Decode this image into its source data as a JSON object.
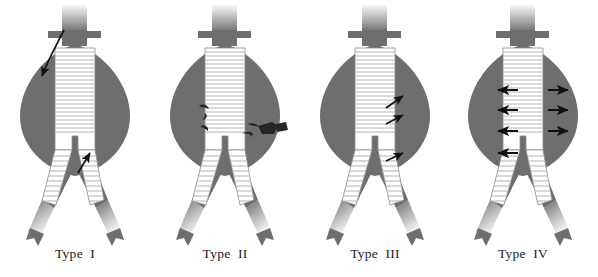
{
  "figure": {
    "background_color": "#ffffff",
    "width": 598,
    "height": 277
  },
  "colors": {
    "vessel_fill": "#6e6e6e",
    "aneurysm_sac": "#6e6e6e",
    "graft_fill": "#ffffff",
    "graft_ring": "#b4b4b4",
    "graft_outline": "#8a8a8a",
    "arrow": "#111111",
    "collateral_mark": "#262626",
    "caption_text": "#1a1a1a",
    "background": "#ffffff"
  },
  "panels": [
    {
      "id": "type-1",
      "caption": "Type  I",
      "leak_name": "attachment-site-endoleak",
      "x": 0,
      "arrows": [
        {
          "name": "proximal-neck-leak-arrow",
          "style": "curved",
          "x1": 64,
          "y1": 30,
          "x2": 40,
          "y2": 78
        },
        {
          "name": "distal-iliac-leak-arrow",
          "style": "straight",
          "x1": 78,
          "y1": 172,
          "x2": 90,
          "y2": 152
        }
      ],
      "collaterals": []
    },
    {
      "id": "type-2",
      "caption": "Type  II",
      "leak_name": "branch-vessel-retrograde-endoleak",
      "x": 150,
      "arrows": [],
      "collaterals": [
        {
          "name": "lumbar-branch-left-upper",
          "cx": 53,
          "cy": 111
        },
        {
          "name": "lumbar-branch-left-lower",
          "cx": 54,
          "cy": 128
        },
        {
          "name": "lumbar-branch-right-stub",
          "cx": 103,
          "cy": 130
        },
        {
          "name": "inferior-mesenteric-branch",
          "cx": 116,
          "cy": 132
        }
      ]
    },
    {
      "id": "type-3",
      "caption": "Type  III",
      "leak_name": "modular-disconnection-or-fabric-tear-endoleak",
      "x": 300,
      "arrows": [
        {
          "name": "graft-defect-arrow-upper",
          "style": "straight",
          "x1": 86,
          "y1": 106,
          "x2": 102,
          "y2": 96
        },
        {
          "name": "graft-defect-arrow-middle",
          "style": "straight",
          "x1": 86,
          "y1": 122,
          "x2": 102,
          "y2": 114
        },
        {
          "name": "graft-defect-arrow-lower",
          "style": "straight",
          "x1": 86,
          "y1": 160,
          "x2": 102,
          "y2": 152
        }
      ],
      "collaterals": []
    },
    {
      "id": "type-4",
      "caption": "Type  IV",
      "leak_name": "graft-porosity-endoleak",
      "x": 448,
      "arrows": [
        {
          "name": "porosity-arrow-left-1",
          "style": "straight",
          "x1": 72,
          "y1": 91,
          "x2": 52,
          "y2": 91
        },
        {
          "name": "porosity-arrow-left-2",
          "style": "straight",
          "x1": 72,
          "y1": 110,
          "x2": 52,
          "y2": 110
        },
        {
          "name": "porosity-arrow-left-3",
          "style": "straight",
          "x1": 72,
          "y1": 131,
          "x2": 52,
          "y2": 131
        },
        {
          "name": "porosity-arrow-left-4",
          "style": "straight",
          "x1": 72,
          "y1": 153,
          "x2": 52,
          "y2": 153
        },
        {
          "name": "porosity-arrow-right-1",
          "style": "straight",
          "x1": 100,
          "y1": 91,
          "x2": 120,
          "y2": 91
        },
        {
          "name": "porosity-arrow-right-2",
          "style": "straight",
          "x1": 100,
          "y1": 110,
          "x2": 120,
          "y2": 110
        },
        {
          "name": "porosity-arrow-right-3",
          "style": "straight",
          "x1": 100,
          "y1": 131,
          "x2": 120,
          "y2": 131
        }
      ],
      "collaterals": []
    }
  ],
  "anatomy": {
    "aorta_label": "suprarenal-aorta",
    "renal_label": "renal-artery-branch",
    "sac_label": "aneurysm-sac",
    "graft_label": "stent-graft-body",
    "limb_label": "stent-graft-iliac-limb",
    "iliac_label": "common-iliac-artery",
    "hypogastric_label": "internal-iliac-branch",
    "graft_ring_count": 26
  }
}
